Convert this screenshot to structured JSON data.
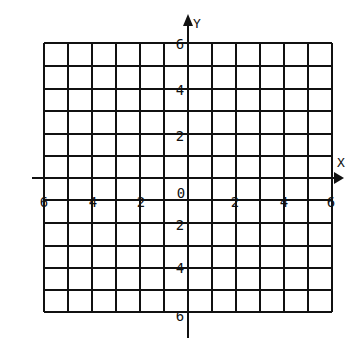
{
  "diagram": {
    "type": "coordinate-grid",
    "axes": {
      "x_label": "X",
      "y_label": "Y",
      "x_ticks": [
        "6",
        "4",
        "2",
        "0",
        "2",
        "4",
        "6"
      ],
      "y_ticks_top": [
        "6",
        "4",
        "2"
      ],
      "y_origin": "0",
      "y_ticks_bottom": [
        "2",
        "4",
        "6"
      ]
    },
    "grid": {
      "columns": 12,
      "rows": 12,
      "range_x": [
        -6,
        6
      ],
      "range_y": [
        -6,
        6
      ]
    },
    "colors": {
      "line": "#111111",
      "background": "#ffffff"
    }
  }
}
